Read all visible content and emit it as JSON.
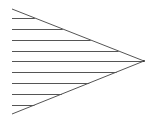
{
  "diagram": {
    "type": "hatched-triangle",
    "width": 154,
    "height": 125,
    "stroke_color": "#555555",
    "stroke_width": 1,
    "triangle": {
      "top_left": [
        12,
        9
      ],
      "bottom_left": [
        12,
        114
      ],
      "apex": [
        144,
        61
      ]
    },
    "hatch_lines_y": [
      18,
      29,
      40,
      51,
      61,
      72,
      83,
      94,
      105
    ],
    "hatch_start_x": 12
  }
}
